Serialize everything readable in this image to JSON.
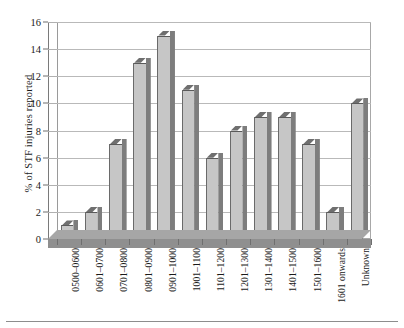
{
  "chart_data": {
    "type": "bar",
    "title": "",
    "xlabel": "",
    "ylabel": "% of STF injuries reported",
    "ylim": [
      0,
      16
    ],
    "ytick_step": 2,
    "yticks": [
      0,
      2,
      4,
      6,
      8,
      10,
      12,
      14,
      16
    ],
    "grid": true,
    "legend": false,
    "style": "3d-column",
    "categories": [
      "0500–0600",
      "0601–0700",
      "0701–0800",
      "0801–0900",
      "0901–1000",
      "1001–1100",
      "1101–1200",
      "1201–1300",
      "1301–1400",
      "1401–1500",
      "1501–1600",
      "1601 onwards",
      "Unknown"
    ],
    "values": [
      1,
      2,
      7,
      13,
      15,
      11,
      6,
      8,
      9,
      9,
      7,
      2,
      10
    ]
  },
  "colors": {
    "bar_face": "#c6c6c6",
    "bar_side": "#7d7d7d",
    "bar_top": "#6f6f6f",
    "floor": "#a6a6a6",
    "gridline": "#b9b9b9",
    "axis": "#7a7a7a",
    "text": "#1a1a1a"
  }
}
